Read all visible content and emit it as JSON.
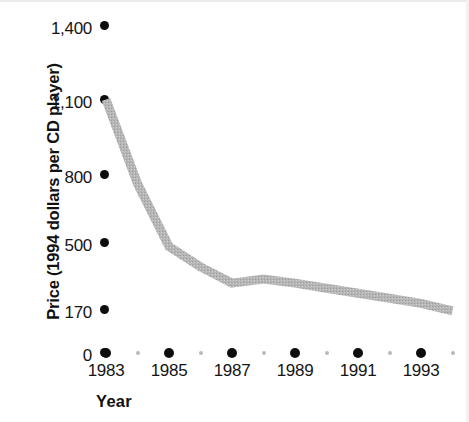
{
  "chart_data": {
    "type": "line",
    "title": "",
    "xlabel": "Year",
    "ylabel": "Price (1994 dollars per CD player)",
    "grid": false,
    "legend": "none",
    "x": [
      1983,
      1984,
      1985,
      1986,
      1987,
      1988,
      1989,
      1990,
      1991,
      1992,
      1993,
      1994
    ],
    "values": [
      1100,
      760,
      480,
      380,
      300,
      320,
      300,
      275,
      250,
      225,
      200,
      165
    ],
    "series": [
      {
        "name": "Price (1994 dollars per CD player)",
        "values": [
          1100,
          760,
          480,
          380,
          300,
          320,
          300,
          275,
          250,
          225,
          200,
          165
        ]
      }
    ],
    "xticklabels": [
      "1983",
      "1985",
      "1987",
      "1989",
      "1991",
      "1993"
    ],
    "xtickvalues": [
      1983,
      1985,
      1987,
      1989,
      1991,
      1993
    ],
    "xminorticks": [
      1984,
      1986,
      1988,
      1990,
      1992,
      1994
    ],
    "yticklabels": [
      "0",
      "170",
      "500",
      "800",
      "1,100",
      "1,400"
    ],
    "ytickvalues": [
      0,
      170,
      500,
      800,
      1100,
      1400
    ],
    "ylim": [
      0,
      1400
    ],
    "xlim": [
      1983,
      1994
    ],
    "line_color": "#b2b2b2",
    "tick_color": "#0d0d0d",
    "text_color": "#151515"
  },
  "axes": {
    "y_title": "Price (1994 dollars per CD player)",
    "x_title": "Year",
    "y_ticks": [
      {
        "label": "1,400",
        "value": 1400
      },
      {
        "label": "1,100",
        "value": 1100
      },
      {
        "label": "800",
        "value": 800
      },
      {
        "label": "500",
        "value": 500
      },
      {
        "label": "170",
        "value": 170
      },
      {
        "label": "0",
        "value": 0
      }
    ],
    "x_ticks": [
      {
        "label": "1983",
        "value": 1983
      },
      {
        "label": "1985",
        "value": 1985
      },
      {
        "label": "1987",
        "value": 1987
      },
      {
        "label": "1989",
        "value": 1989
      },
      {
        "label": "1991",
        "value": 1991
      },
      {
        "label": "1993",
        "value": 1993
      }
    ]
  }
}
